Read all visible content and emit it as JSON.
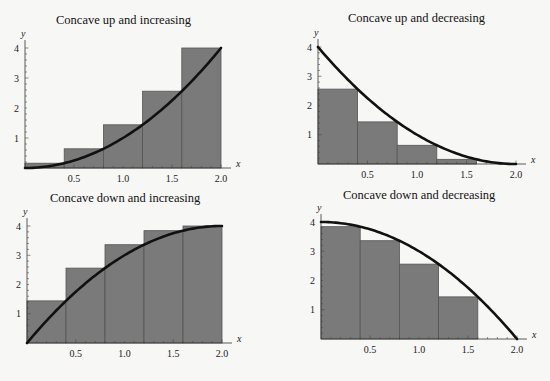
{
  "chart_data": [
    {
      "type": "bar",
      "title": "Concave up and increasing",
      "xlabel": "x",
      "ylabel": "y",
      "xlim": [
        0,
        2.0
      ],
      "ylim": [
        0,
        4
      ],
      "xticks": [
        "0.5",
        "1.0",
        "1.5",
        "2.0"
      ],
      "yticks": [
        "1",
        "2",
        "3",
        "4"
      ],
      "grid": false,
      "function": "f(x) = x^2",
      "rectangles": {
        "x_left": [
          0,
          0.4,
          0.8,
          1.2,
          1.6
        ],
        "width": 0.4,
        "heights": [
          0.16,
          0.64,
          1.44,
          2.56,
          4.0
        ],
        "rule": "right endpoint"
      }
    },
    {
      "type": "bar",
      "title": "Concave up and decreasing",
      "xlabel": "x",
      "ylabel": "y",
      "xlim": [
        0,
        2.0
      ],
      "ylim": [
        0,
        4
      ],
      "xticks": [
        "0.5",
        "1.0",
        "1.5",
        "2.0"
      ],
      "yticks": [
        "1",
        "2",
        "3",
        "4"
      ],
      "grid": false,
      "function": "f(x) = (2-x)^2",
      "rectangles": {
        "x_left": [
          0,
          0.4,
          0.8,
          1.2,
          1.6
        ],
        "width": 0.4,
        "heights": [
          2.56,
          1.44,
          0.64,
          0.16,
          0.0
        ],
        "rule": "right endpoint"
      }
    },
    {
      "type": "bar",
      "title": "Concave down and increasing",
      "xlabel": "x",
      "ylabel": "y",
      "xlim": [
        0,
        2.0
      ],
      "ylim": [
        0,
        4
      ],
      "xticks": [
        "0.5",
        "1.0",
        "1.5",
        "2.0"
      ],
      "yticks": [
        "1",
        "2",
        "3",
        "4"
      ],
      "grid": false,
      "function": "f(x) = 4 - (2-x)^2",
      "rectangles": {
        "x_left": [
          0,
          0.4,
          0.8,
          1.2,
          1.6
        ],
        "width": 0.4,
        "heights": [
          1.44,
          2.56,
          3.36,
          3.84,
          4.0
        ],
        "rule": "right endpoint"
      }
    },
    {
      "type": "bar",
      "title": "Concave down and decreasing",
      "xlabel": "x",
      "ylabel": "y",
      "xlim": [
        0,
        2.0
      ],
      "ylim": [
        0,
        4
      ],
      "xticks": [
        "0.5",
        "1.0",
        "1.5",
        "2.0"
      ],
      "yticks": [
        "1",
        "2",
        "3",
        "4"
      ],
      "grid": false,
      "function": "f(x) = 4 - x^2",
      "rectangles": {
        "x_left": [
          0,
          0.4,
          0.8,
          1.2,
          1.6
        ],
        "width": 0.4,
        "heights": [
          3.84,
          3.36,
          2.56,
          1.44,
          0.0
        ],
        "rule": "right endpoint"
      }
    }
  ],
  "panels": [
    {
      "title": "Concave up and increasing"
    },
    {
      "title": "Concave up and decreasing"
    },
    {
      "title": "Concave down and increasing"
    },
    {
      "title": "Concave down and decreasing"
    }
  ],
  "axis": {
    "x_label": "x",
    "y_label": "y",
    "xticks": [
      "0.5",
      "1.0",
      "1.5",
      "2.0"
    ],
    "yticks": [
      "1",
      "2",
      "3",
      "4"
    ]
  },
  "colors": {
    "bar_fill": "#7a7a7a",
    "bar_edge": "#555555",
    "curve": "#111111",
    "background": "#f7f7f5"
  }
}
